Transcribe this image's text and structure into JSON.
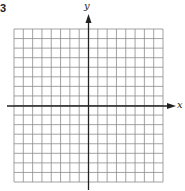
{
  "figure": {
    "corner_label": "3",
    "axes": {
      "x_label": "x",
      "y_label": "y"
    },
    "grid": {
      "columns": 16,
      "rows": 16,
      "left": 14,
      "top": 29,
      "right": 163,
      "bottom": 182,
      "origin_x": 88.5,
      "origin_y": 106,
      "line_color": "#8c8c8c",
      "axis_color": "#222222"
    }
  }
}
